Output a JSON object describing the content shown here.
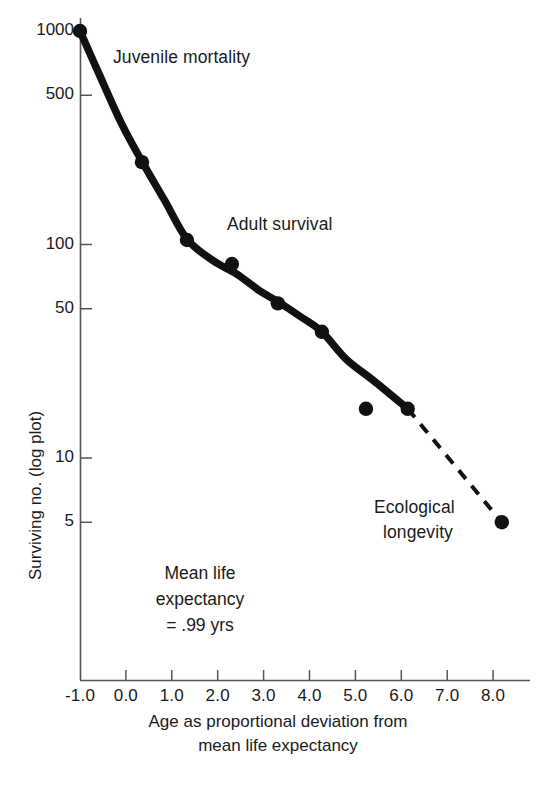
{
  "chart_data": {
    "type": "line",
    "title": "",
    "xlabel": "Age as proportional deviation from mean life expectancy",
    "ylabel": "Surviving no. (log plot)",
    "xlabel_line1": "Age as proportional deviation from",
    "xlabel_line2": "mean life expectancy",
    "x_ticks": [
      "-1.0",
      "0.0",
      "1.0",
      "2.0",
      "3.0",
      "4.0",
      "5.0",
      "6.0",
      "7.0",
      "8.0"
    ],
    "x_tick_values": [
      -1.0,
      0.0,
      1.0,
      2.0,
      3.0,
      4.0,
      5.0,
      6.0,
      7.0,
      8.0
    ],
    "y_ticks": [
      "1000",
      "500",
      "100",
      "50",
      "10",
      "5"
    ],
    "y_tick_values": [
      1000,
      500,
      100,
      50,
      10,
      5
    ],
    "xlim": [
      -1.0,
      8.6
    ],
    "ylim": [
      3.6,
      1300
    ],
    "yscale": "log",
    "grid": false,
    "legend": "none",
    "series": [
      {
        "name": "Survivorship points",
        "style": "scatter",
        "points": [
          {
            "x": -1.0,
            "y": 1000
          },
          {
            "x": 0.35,
            "y": 243
          },
          {
            "x": 1.33,
            "y": 105
          },
          {
            "x": 2.31,
            "y": 81
          },
          {
            "x": 3.31,
            "y": 53
          },
          {
            "x": 4.27,
            "y": 39
          },
          {
            "x": 5.23,
            "y": 17
          },
          {
            "x": 6.14,
            "y": 17
          },
          {
            "x": 8.19,
            "y": 5
          }
        ]
      },
      {
        "name": "Fitted survivorship curve",
        "style": "solid-thick",
        "points": [
          {
            "x": -1.0,
            "y": 1000
          },
          {
            "x": -0.6,
            "y": 640
          },
          {
            "x": -0.1,
            "y": 370
          },
          {
            "x": 0.35,
            "y": 245
          },
          {
            "x": 0.85,
            "y": 160
          },
          {
            "x": 1.33,
            "y": 106
          },
          {
            "x": 1.9,
            "y": 84
          },
          {
            "x": 2.4,
            "y": 73
          },
          {
            "x": 2.9,
            "y": 61
          },
          {
            "x": 3.31,
            "y": 54
          },
          {
            "x": 3.8,
            "y": 46
          },
          {
            "x": 4.27,
            "y": 39
          },
          {
            "x": 4.8,
            "y": 29
          },
          {
            "x": 5.4,
            "y": 23
          },
          {
            "x": 6.14,
            "y": 17
          }
        ]
      },
      {
        "name": "Extrapolated ecological longevity",
        "style": "dashed",
        "points": [
          {
            "x": 6.14,
            "y": 17
          },
          {
            "x": 8.19,
            "y": 5
          }
        ]
      }
    ],
    "annotations": [
      {
        "id": "juvenile-mortality",
        "text": "Juvenile mortality",
        "x_px": 113,
        "y_px": 47
      },
      {
        "id": "adult-survival",
        "text": "Adult survival",
        "x_px": 227,
        "y_px": 214
      },
      {
        "id": "ecological-longevity-line1",
        "text": "Ecological",
        "x_px": 374,
        "y_px": 497
      },
      {
        "id": "ecological-longevity-line2",
        "text": "longevity",
        "x_px": 383,
        "y_px": 522
      }
    ],
    "note_lines": [
      "Mean life",
      "expectancy",
      "= .99 yrs"
    ],
    "colors": {
      "ink": "#1a1a1a",
      "axis": "#555555",
      "background": "#ffffff"
    }
  }
}
